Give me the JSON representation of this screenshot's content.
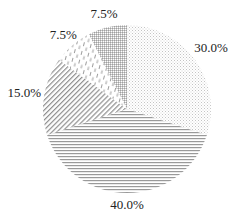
{
  "chart_data": {
    "type": "pie",
    "title": "",
    "start_angle": "12 o'clock",
    "direction": "clockwise",
    "categories": [
      "Slice A",
      "Slice B",
      "Slice C",
      "Slice D",
      "Slice E"
    ],
    "values": [
      30.0,
      40.0,
      15.0,
      7.5,
      7.5
    ],
    "labels": [
      "30.0%",
      "40.0%",
      "15.0%",
      "7.5%",
      "7.5%"
    ],
    "patterns": [
      "dots",
      "horizontal-lines",
      "diagonal-lines",
      "dashed-vertical",
      "grid"
    ],
    "colors": [
      "#bdbdbd",
      "#9a9a9a",
      "#8f8f8f",
      "#9c9c9c",
      "#a8a8a8"
    ],
    "legend": "none"
  }
}
